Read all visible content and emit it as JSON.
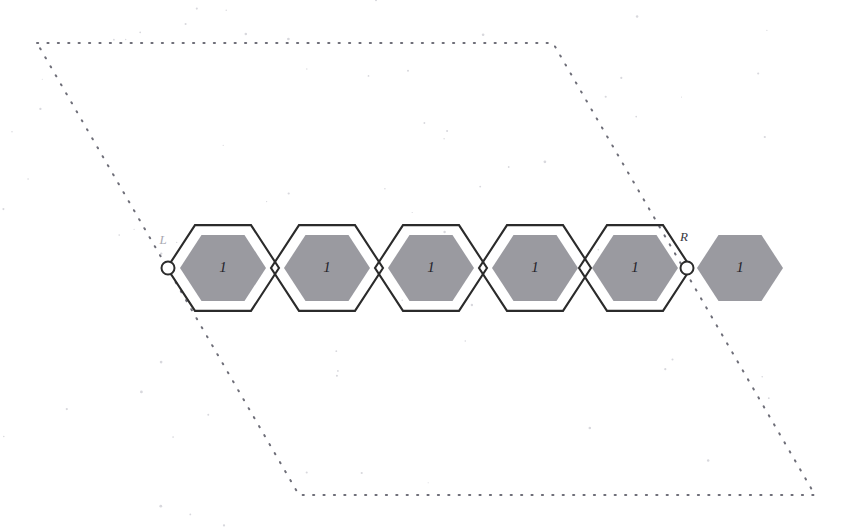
{
  "figure": {
    "background_color": "#ffffff",
    "width": 845,
    "height": 530
  },
  "colors": {
    "hex_outline": "#2b2b2b",
    "hex_fill_gray": "#9a9aa0",
    "dotted_boundary": "#6e6e78",
    "node_stroke": "#2b2b2b",
    "node_fill": "#ffffff",
    "label_dark": "#23232a",
    "label_faint": "#a9a9b2"
  },
  "boundary": {
    "name": "dotted-parallelogram",
    "style": "dotted",
    "corners": [
      {
        "x": 37,
        "y": 43
      },
      {
        "x": 553,
        "y": 43
      },
      {
        "x": 815,
        "y": 495
      },
      {
        "x": 299,
        "y": 495
      }
    ]
  },
  "chain": {
    "center_y": 268,
    "hex_radius": 56,
    "inner_radius": 43,
    "step_x": 104,
    "first_center_x": 223,
    "cells": [
      {
        "index": 1,
        "cx": 223,
        "cy": 268,
        "label": "1",
        "outlined": true,
        "filled": true
      },
      {
        "index": 2,
        "cx": 327,
        "cy": 268,
        "label": "1",
        "outlined": true,
        "filled": true
      },
      {
        "index": 3,
        "cx": 431,
        "cy": 268,
        "label": "1",
        "outlined": true,
        "filled": true
      },
      {
        "index": 4,
        "cx": 535,
        "cy": 268,
        "label": "1",
        "outlined": true,
        "filled": true
      },
      {
        "index": 5,
        "cx": 635,
        "cy": 268,
        "label": "1",
        "outlined": true,
        "filled": true
      },
      {
        "index": 6,
        "cx": 740,
        "cy": 268,
        "label": "1",
        "outlined": false,
        "filled": true
      }
    ]
  },
  "nodes": [
    {
      "name": "left-endpoint",
      "cx": 168,
      "cy": 268,
      "r": 6.5
    },
    {
      "name": "right-endpoint",
      "cx": 687,
      "cy": 268,
      "r": 6.5
    }
  ],
  "annotations": {
    "left": {
      "text": "L",
      "x": 163,
      "y": 241
    },
    "right": {
      "text": "R",
      "x": 684,
      "y": 238
    }
  }
}
